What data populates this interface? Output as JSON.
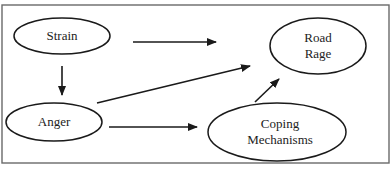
{
  "diagram": {
    "type": "path-model",
    "colors": {
      "stroke": "#1a1a1a",
      "frame": "#6a6a6a",
      "background": "#ffffff",
      "text": "#222222"
    },
    "nodes": {
      "strain": {
        "label": "Strain",
        "lines": [
          "Strain"
        ]
      },
      "anger": {
        "label": "Anger",
        "lines": [
          "Anger"
        ]
      },
      "road_rage": {
        "label": "Road Rage",
        "lines": [
          "Road",
          "Rage"
        ]
      },
      "coping": {
        "label": "Coping Mechanisms",
        "lines": [
          "Coping",
          "Mechanisms"
        ]
      }
    },
    "edges": [
      {
        "from": "Strain",
        "to": "Road Rage"
      },
      {
        "from": "Strain",
        "to": "Anger"
      },
      {
        "from": "Anger",
        "to": "Road Rage"
      },
      {
        "from": "Anger",
        "to": "Coping Mechanisms"
      },
      {
        "from": "Coping Mechanisms",
        "to": "Road Rage"
      }
    ]
  }
}
